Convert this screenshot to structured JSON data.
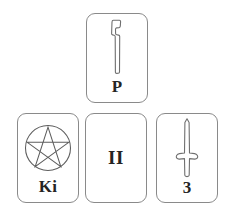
{
  "scene": {
    "title": "Tarot card spread",
    "background_color": "#ffffff",
    "card_border_color": "#8a8a8a",
    "ink_color": "#242424",
    "art_stroke_color": "#6f6f6f"
  },
  "cards": [
    {
      "id": "wand",
      "position": "top-center",
      "label": "P",
      "label_placement": "bottom",
      "suit": "wands",
      "icon": "wand-icon",
      "art_description": "vertical wooden wand / baton"
    },
    {
      "id": "pentacle",
      "position": "bottom-left",
      "label": "Ki",
      "label_placement": "bottom",
      "suit": "pentacles",
      "icon": "pentacle-icon",
      "art_description": "pentagram inscribed in a circle"
    },
    {
      "id": "two",
      "position": "bottom-center",
      "label": "II",
      "label_placement": "center",
      "suit": "",
      "icon": "",
      "art_description": "roman numeral two only"
    },
    {
      "id": "sword",
      "position": "bottom-right",
      "label": "3",
      "label_placement": "bottom",
      "suit": "swords",
      "icon": "sword-icon",
      "art_description": "upright sword with crossguard"
    }
  ]
}
